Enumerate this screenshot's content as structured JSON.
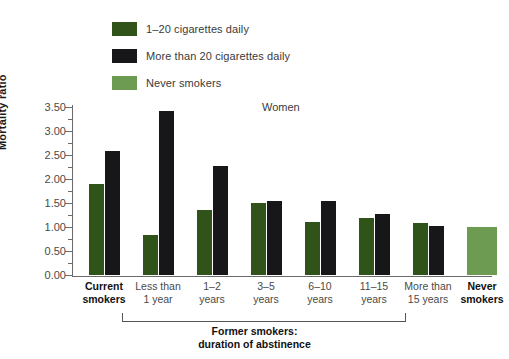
{
  "chart_data": {
    "type": "bar",
    "title": "Women",
    "xlabel": "Former smokers: duration of abstinence",
    "ylabel": "Mortality ratio",
    "ylim": [
      0,
      3.5
    ],
    "ytick_labels": [
      "3.50",
      "3.00",
      "2.50",
      "2.00",
      "1.50",
      "1.00",
      "0.50",
      "0.00"
    ],
    "ytick_values": [
      3.5,
      3.0,
      2.5,
      2.0,
      1.5,
      1.0,
      0.5,
      0.0
    ],
    "ytick_step": 0.5,
    "minor_tick_step": 0.25,
    "grid": false,
    "legend_position": "top-left",
    "categories": [
      "Current smokers",
      "Less than 1 year",
      "1–2 years",
      "3–5 years",
      "6–10 years",
      "11–15 years",
      "More than 15 years",
      "Never smokers"
    ],
    "series": [
      {
        "name": "1–20 cigarettes daily",
        "color": "#2f5318",
        "values": [
          1.9,
          0.83,
          1.35,
          1.5,
          1.1,
          1.18,
          1.08,
          null
        ]
      },
      {
        "name": "More than 20 cigarettes daily",
        "color": "#17171a",
        "values": [
          2.58,
          3.42,
          2.28,
          1.55,
          1.55,
          1.27,
          1.02,
          null
        ]
      },
      {
        "name": "Never smokers",
        "color": "#6d9b52",
        "values": [
          null,
          null,
          null,
          null,
          null,
          null,
          null,
          1.0
        ]
      }
    ]
  },
  "legend": {
    "items": [
      {
        "label": "1–20 cigarettes daily",
        "color": "#2f5318"
      },
      {
        "label": "More than 20 cigarettes daily",
        "color": "#17171a"
      },
      {
        "label": "Never smokers",
        "color": "#6d9b52"
      }
    ]
  },
  "axis": {
    "y_title": "Mortality ratio"
  },
  "x_categories": [
    {
      "line1": "Current",
      "line2": "smokers",
      "bold": true,
      "center": 32
    },
    {
      "line1": "Less than",
      "line2": "1 year",
      "bold": false,
      "center": 86
    },
    {
      "line1": "1–2",
      "line2": "years",
      "bold": false,
      "center": 140
    },
    {
      "line1": "3–5",
      "line2": "years",
      "bold": false,
      "center": 194
    },
    {
      "line1": "6–10",
      "line2": "years",
      "bold": false,
      "center": 248
    },
    {
      "line1": "11–15",
      "line2": "years",
      "bold": false,
      "center": 302
    },
    {
      "line1": "More than",
      "line2": "15 years",
      "bold": false,
      "center": 356
    },
    {
      "line1": "Never",
      "line2": "smokers",
      "bold": true,
      "center": 410
    }
  ],
  "footer": {
    "line1": "Former smokers:",
    "line2": "duration of abstinence"
  }
}
